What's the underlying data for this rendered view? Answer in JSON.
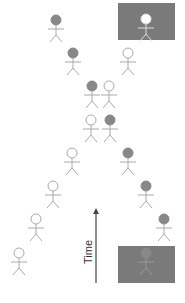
{
  "diagram": {
    "time_label": "Time",
    "colors": {
      "box": "#7a7a7a",
      "figure_dark_head": "#888888",
      "figure_line": "#aaaaaa",
      "figure_white_head": "#ffffff",
      "arrow": "#444444"
    },
    "boxes": [
      {
        "name": "top-highlight-box",
        "x": 118,
        "y": 3,
        "w": 57,
        "h": 37
      },
      {
        "name": "bottom-highlight-box",
        "x": 118,
        "y": 246,
        "w": 57,
        "h": 37
      }
    ],
    "figures": [
      {
        "x": 56,
        "y": 23,
        "head": "dark"
      },
      {
        "x": 73,
        "y": 56,
        "head": "dark"
      },
      {
        "x": 92,
        "y": 89,
        "head": "dark"
      },
      {
        "x": 109,
        "y": 89,
        "head": "white"
      },
      {
        "x": 91,
        "y": 123,
        "head": "white"
      },
      {
        "x": 110,
        "y": 123,
        "head": "dark"
      },
      {
        "x": 72,
        "y": 156,
        "head": "white"
      },
      {
        "x": 53,
        "y": 189,
        "head": "white"
      },
      {
        "x": 36,
        "y": 222,
        "head": "white"
      },
      {
        "x": 19,
        "y": 256,
        "head": "white"
      },
      {
        "x": 146,
        "y": 22,
        "head": "white-in-box"
      },
      {
        "x": 128,
        "y": 56,
        "head": "white"
      },
      {
        "x": 128,
        "y": 156,
        "head": "dark"
      },
      {
        "x": 146,
        "y": 189,
        "head": "dark"
      },
      {
        "x": 164,
        "y": 222,
        "head": "dark"
      },
      {
        "x": 146,
        "y": 256,
        "head": "dark-in-box"
      }
    ],
    "arrow": {
      "x": 96,
      "y_top": 208,
      "y_bottom": 283
    }
  }
}
